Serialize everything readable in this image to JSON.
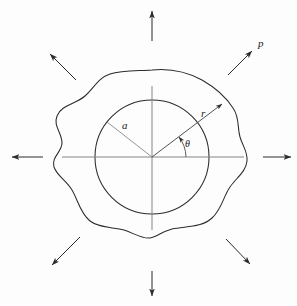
{
  "figure": {
    "background_color": "#fdfdfd",
    "line_color": "#2b2b2b",
    "axis_color": "#6e6e6e",
    "label_color": "#1a1a1a"
  },
  "labels": {
    "hole_radius": "a",
    "radial_coordinate": "r",
    "angular_coordinate": "θ",
    "pressure": "p"
  },
  "geometry": {
    "center": {
      "x": 152,
      "y": 157
    },
    "hole_radius_px": 57,
    "radial_ray_angle_deg": 37,
    "a_ray_angle_deg": 142,
    "theta_arc_radius_px": 34
  },
  "load_arrows": [
    {
      "name": "arrow-north",
      "direction": "up",
      "from": {
        "x": 152,
        "y": 41
      },
      "to": {
        "x": 152,
        "y": 11
      }
    },
    {
      "name": "arrow-northeast",
      "direction": "up-right",
      "from": {
        "x": 228,
        "y": 75
      },
      "to": {
        "x": 252,
        "y": 51
      }
    },
    {
      "name": "arrow-east",
      "direction": "right",
      "from": {
        "x": 263,
        "y": 157
      },
      "to": {
        "x": 291,
        "y": 157
      }
    },
    {
      "name": "arrow-southeast",
      "direction": "down-right",
      "from": {
        "x": 226,
        "y": 239
      },
      "to": {
        "x": 250,
        "y": 264
      }
    },
    {
      "name": "arrow-south",
      "direction": "down",
      "from": {
        "x": 152,
        "y": 271
      },
      "to": {
        "x": 152,
        "y": 296
      }
    },
    {
      "name": "arrow-southwest",
      "direction": "down-left",
      "from": {
        "x": 80,
        "y": 237
      },
      "to": {
        "x": 52,
        "y": 265
      }
    },
    {
      "name": "arrow-west",
      "direction": "left",
      "from": {
        "x": 43,
        "y": 157
      },
      "to": {
        "x": 12,
        "y": 157
      }
    },
    {
      "name": "arrow-northwest",
      "direction": "up-left",
      "from": {
        "x": 76,
        "y": 80
      },
      "to": {
        "x": 50,
        "y": 54
      }
    }
  ]
}
